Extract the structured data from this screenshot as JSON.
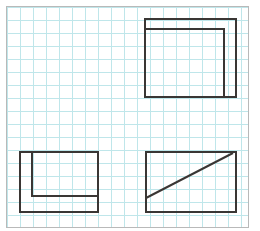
{
  "page": {
    "width": 260,
    "height": 231,
    "background_color": "#ffffff",
    "title": "Orthographic Views Grid Worksheet"
  },
  "sheet": {
    "name": "graph-paper-sheet",
    "x": 6,
    "y": 6,
    "width": 243,
    "height": 222,
    "border_color": "#b9b9b9",
    "background_color": "#ffffff"
  },
  "grid": {
    "name": "graph-grid",
    "spacing": 13,
    "line_color": "#bfe6ea",
    "minor_line_color": "#d6eef1",
    "origin_x": 7,
    "origin_y": 7,
    "columns": 19,
    "rows": 18,
    "visible": true
  },
  "drawing": {
    "stroke_color": "#3a3634",
    "stroke_width": 2,
    "quadrants": [
      "top-left",
      "top-right",
      "bottom-left",
      "bottom-right"
    ],
    "figure_count": 3
  },
  "figures": [
    {
      "id": "figure-top-left",
      "name": "empty-quadrant",
      "label": "Empty",
      "present": false,
      "description": "Blank grid area with no drawing",
      "bounds": {
        "x": 7,
        "y": 7,
        "width": 130,
        "height": 115
      }
    },
    {
      "id": "figure-top-right",
      "name": "stepped-rectangle-top-right",
      "label": "Stepped rectangle with inner top-left L",
      "present": true,
      "description": "Outer rectangle with an inner horizontal line offset below the top edge joined to a vertical line down to the bottom edge",
      "outer_rect": {
        "x1": 145,
        "y1": 19,
        "x2": 236,
        "y2": 97
      },
      "inner_path": [
        {
          "x": 145,
          "y": 29
        },
        {
          "x": 224,
          "y": 29
        },
        {
          "x": 224,
          "y": 97
        }
      ]
    },
    {
      "id": "figure-bottom-left",
      "name": "stepped-rectangle-bottom-left",
      "label": "Rectangle with inner L from top edge to right edge",
      "present": true,
      "description": "Outer rectangle with an inner vertical line from the top edge descending then turning right to the right edge",
      "outer_rect": {
        "x1": 20,
        "y1": 152,
        "x2": 98,
        "y2": 212
      },
      "inner_path": [
        {
          "x": 32,
          "y": 152
        },
        {
          "x": 32,
          "y": 196
        },
        {
          "x": 98,
          "y": 196
        }
      ]
    },
    {
      "id": "figure-bottom-right",
      "name": "rectangle-with-diagonal",
      "label": "Rectangle with diagonal line",
      "present": true,
      "description": "Rectangle containing a diagonal running from the left edge upward to near the top-right corner",
      "outer_rect": {
        "x1": 146,
        "y1": 152,
        "x2": 236,
        "y2": 212
      },
      "diagonal": {
        "x1": 146,
        "y1": 198,
        "x2": 233,
        "y2": 153
      }
    }
  ]
}
